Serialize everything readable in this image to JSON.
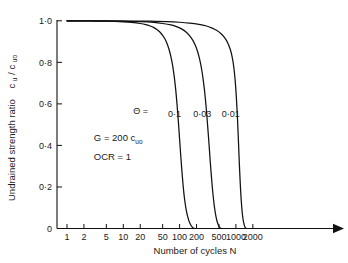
{
  "chart_data": {
    "type": "line",
    "title": "",
    "xlabel": "Number of cycles  N",
    "ylabel": "Undrained strength ratio  c_u/c_uo",
    "ylabel_parts": {
      "main": "Undrained strength ratio",
      "num_base": "c",
      "num_sub": "u",
      "slash": "/",
      "den_base": "c",
      "den_sub": "uo"
    },
    "xscale": "log",
    "xlim": [
      1,
      3000
    ],
    "ylim": [
      0,
      1.0
    ],
    "grid": false,
    "legend": "inline-curve-labels",
    "xticks": [
      1,
      2,
      5,
      10,
      20,
      50,
      100,
      200,
      500,
      1000,
      2000
    ],
    "xtick_labels": [
      "1",
      "2",
      "5",
      "10",
      "20",
      "50",
      "100",
      "200",
      "500",
      "1000",
      "2000"
    ],
    "yticks": [
      0,
      0.2,
      0.4,
      0.6,
      0.8,
      1.0
    ],
    "ytick_labels": [
      "0",
      "0·2",
      "0·4",
      "0·6",
      "0·8",
      "1·0"
    ],
    "x_axis_arrow": true,
    "annotations": [
      {
        "name": "shear-modulus-note",
        "text": "G = 200 c",
        "sub": "uo",
        "x_data": 3.0,
        "y_data": 0.42
      },
      {
        "name": "ocr-note",
        "text": "OCR = 1",
        "sub": "",
        "x_data": 3.0,
        "y_data": 0.33
      }
    ],
    "series_prefix_symbol": "Θ =",
    "series": [
      {
        "name": "0·1",
        "theta": 0.1,
        "label": "0·1",
        "label_x_data": 62,
        "label_y_data": 0.535,
        "points": [
          [
            1,
            1.0
          ],
          [
            2,
            1.0
          ],
          [
            3,
            0.999
          ],
          [
            5,
            0.998
          ],
          [
            7,
            0.997
          ],
          [
            10,
            0.995
          ],
          [
            14,
            0.992
          ],
          [
            20,
            0.987
          ],
          [
            25,
            0.982
          ],
          [
            30,
            0.975
          ],
          [
            35,
            0.967
          ],
          [
            40,
            0.957
          ],
          [
            45,
            0.945
          ],
          [
            50,
            0.93
          ],
          [
            55,
            0.912
          ],
          [
            60,
            0.89
          ],
          [
            65,
            0.862
          ],
          [
            70,
            0.828
          ],
          [
            75,
            0.787
          ],
          [
            80,
            0.735
          ],
          [
            85,
            0.672
          ],
          [
            90,
            0.598
          ],
          [
            95,
            0.515
          ],
          [
            100,
            0.43
          ],
          [
            105,
            0.348
          ],
          [
            110,
            0.275
          ],
          [
            115,
            0.213
          ],
          [
            120,
            0.162
          ],
          [
            126,
            0.118
          ],
          [
            132,
            0.085
          ],
          [
            139,
            0.058
          ],
          [
            146,
            0.038
          ],
          [
            154,
            0.023
          ],
          [
            162,
            0.012
          ],
          [
            170,
            0.005
          ],
          [
            178,
            0.001
          ],
          [
            185,
            0.0
          ]
        ]
      },
      {
        "name": "0·03",
        "theta": 0.03,
        "label": "0·03",
        "label_x_data": 175,
        "label_y_data": 0.535,
        "points": [
          [
            1,
            1.0
          ],
          [
            3,
            1.0
          ],
          [
            6,
            0.999
          ],
          [
            10,
            0.998
          ],
          [
            20,
            0.996
          ],
          [
            35,
            0.992
          ],
          [
            50,
            0.987
          ],
          [
            70,
            0.98
          ],
          [
            90,
            0.971
          ],
          [
            110,
            0.96
          ],
          [
            130,
            0.946
          ],
          [
            150,
            0.929
          ],
          [
            170,
            0.908
          ],
          [
            190,
            0.882
          ],
          [
            205,
            0.858
          ],
          [
            220,
            0.83
          ],
          [
            235,
            0.796
          ],
          [
            250,
            0.756
          ],
          [
            262,
            0.718
          ],
          [
            275,
            0.672
          ],
          [
            288,
            0.62
          ],
          [
            300,
            0.566
          ],
          [
            312,
            0.508
          ],
          [
            325,
            0.445
          ],
          [
            338,
            0.382
          ],
          [
            350,
            0.324
          ],
          [
            363,
            0.268
          ],
          [
            376,
            0.217
          ],
          [
            390,
            0.17
          ],
          [
            405,
            0.129
          ],
          [
            420,
            0.095
          ],
          [
            437,
            0.066
          ],
          [
            455,
            0.043
          ],
          [
            475,
            0.025
          ],
          [
            496,
            0.012
          ],
          [
            520,
            0.004
          ],
          [
            545,
            0.0
          ]
        ]
      },
      {
        "name": "0·01",
        "theta": 0.01,
        "label": "0·01",
        "label_x_data": 560,
        "label_y_data": 0.535,
        "points": [
          [
            1,
            1.0
          ],
          [
            5,
            1.0
          ],
          [
            15,
            0.999
          ],
          [
            30,
            0.998
          ],
          [
            60,
            0.996
          ],
          [
            100,
            0.993
          ],
          [
            150,
            0.989
          ],
          [
            220,
            0.983
          ],
          [
            300,
            0.975
          ],
          [
            380,
            0.965
          ],
          [
            460,
            0.953
          ],
          [
            540,
            0.939
          ],
          [
            610,
            0.924
          ],
          [
            670,
            0.908
          ],
          [
            720,
            0.892
          ],
          [
            770,
            0.873
          ],
          [
            815,
            0.852
          ],
          [
            855,
            0.828
          ],
          [
            890,
            0.802
          ],
          [
            920,
            0.774
          ],
          [
            950,
            0.74
          ],
          [
            975,
            0.706
          ],
          [
            1000,
            0.666
          ],
          [
            1025,
            0.62
          ],
          [
            1050,
            0.568
          ],
          [
            1072,
            0.516
          ],
          [
            1095,
            0.458
          ],
          [
            1118,
            0.398
          ],
          [
            1140,
            0.34
          ],
          [
            1165,
            0.281
          ],
          [
            1190,
            0.227
          ],
          [
            1215,
            0.18
          ],
          [
            1242,
            0.138
          ],
          [
            1270,
            0.102
          ],
          [
            1300,
            0.072
          ],
          [
            1335,
            0.048
          ],
          [
            1372,
            0.029
          ],
          [
            1412,
            0.015
          ],
          [
            1455,
            0.006
          ],
          [
            1500,
            0.001
          ],
          [
            1545,
            0.0
          ]
        ]
      }
    ]
  }
}
